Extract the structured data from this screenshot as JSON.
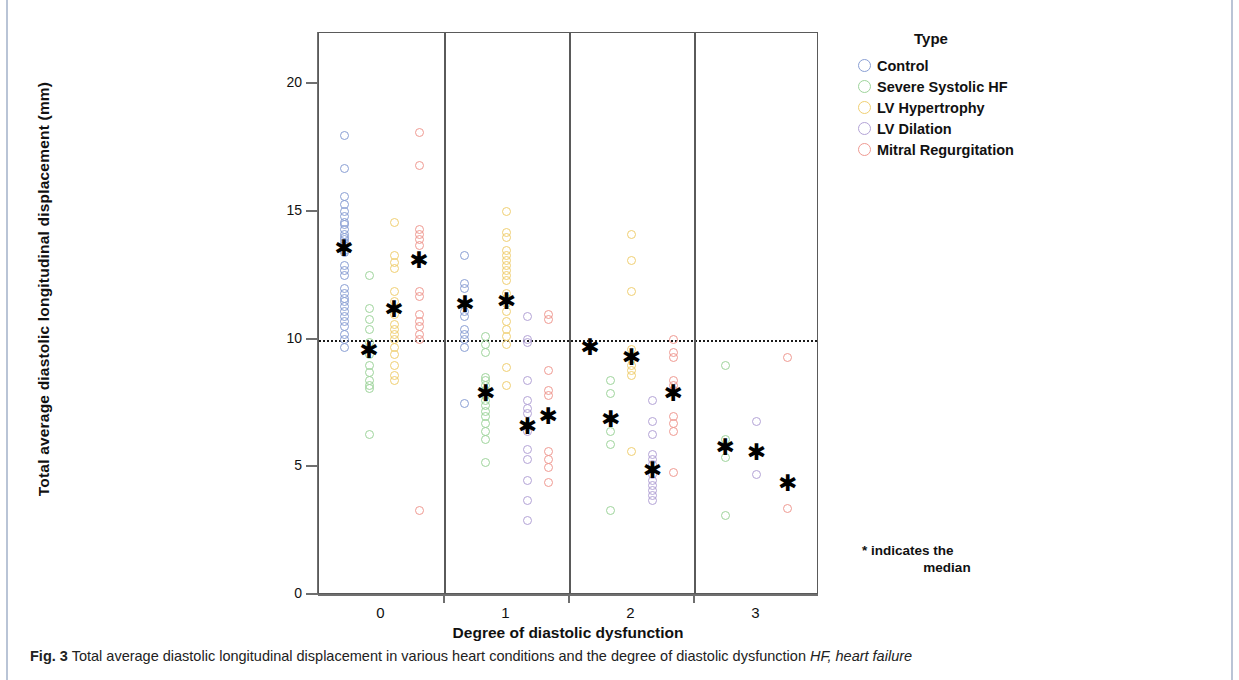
{
  "figure": {
    "caption_number": "Fig. 3",
    "caption_text": "Total average diastolic longitudinal displacement in various heart conditions and the degree of diastolic dysfunction",
    "caption_abbrev": "HF, heart failure"
  },
  "legend": {
    "title": "Type",
    "items": [
      {
        "label": "Control",
        "color": "#8a9fd4"
      },
      {
        "label": "Severe Systolic HF",
        "color": "#9ed49b"
      },
      {
        "label": "LV Hypertrophy",
        "color": "#f0cf72"
      },
      {
        "label": "LV Dilation",
        "color": "#b3a3d6"
      },
      {
        "label": "Mitral Regurgitation",
        "color": "#ef9a92"
      }
    ]
  },
  "annotations": {
    "median_note_line1": "* indicates the",
    "median_note_line2": "median"
  },
  "chart_data": {
    "type": "scatter",
    "title": "",
    "xlabel": "Degree of diastolic dysfunction",
    "ylabel": "Total average diastolic longitudinal displacement (mm)",
    "ylim": [
      0,
      22
    ],
    "yticks": [
      0,
      5,
      10,
      15,
      20
    ],
    "xticks": [
      "0",
      "1",
      "2",
      "3"
    ],
    "grid": false,
    "reference_line": {
      "y": 10,
      "style": "dotted",
      "color": "#1a1a1a"
    },
    "legend_position": "right",
    "panels": [
      {
        "category": "0",
        "groups": [
          {
            "name": "Control",
            "color": "#8a9fd4",
            "median": 13.6,
            "values": [
              18.0,
              16.7,
              15.6,
              15.3,
              15.0,
              14.8,
              14.6,
              14.5,
              14.3,
              14.1,
              14.0,
              13.9,
              13.8,
              13.7,
              13.5,
              13.4,
              12.9,
              12.7,
              12.5,
              12.0,
              11.8,
              11.6,
              11.5,
              11.3,
              11.1,
              10.9,
              10.7,
              10.5,
              10.2,
              10.0,
              9.7
            ]
          },
          {
            "name": "Severe Systolic HF",
            "color": "#9ed49b",
            "median": 9.6,
            "values": [
              12.5,
              11.2,
              10.8,
              10.4,
              9.9,
              9.4,
              9.0,
              8.7,
              8.4,
              8.2,
              8.1,
              6.3
            ]
          },
          {
            "name": "LV Hypertrophy",
            "color": "#f0cf72",
            "median": 11.2,
            "values": [
              14.6,
              13.3,
              13.0,
              12.8,
              11.9,
              11.5,
              11.2,
              11.0,
              10.6,
              10.4,
              10.2,
              10.0,
              9.7,
              9.4,
              9.0,
              8.6,
              8.4
            ]
          },
          {
            "name": "Mitral Regurgitation",
            "color": "#ef9a92",
            "median": 13.1,
            "values": [
              18.1,
              16.8,
              14.3,
              14.1,
              13.9,
              13.7,
              11.9,
              11.7,
              11.0,
              10.7,
              10.5,
              10.2,
              10.0,
              3.3
            ]
          }
        ]
      },
      {
        "category": "1",
        "groups": [
          {
            "name": "Control",
            "color": "#8a9fd4",
            "median": 11.4,
            "values": [
              13.3,
              12.2,
              12.0,
              11.4,
              11.1,
              10.9,
              10.4,
              10.2,
              10.0,
              9.7,
              7.5
            ]
          },
          {
            "name": "Severe Systolic HF",
            "color": "#9ed49b",
            "median": 7.9,
            "values": [
              10.1,
              9.8,
              9.5,
              8.5,
              8.4,
              8.2,
              8.0,
              7.8,
              7.6,
              7.4,
              7.2,
              7.0,
              6.7,
              6.4,
              6.1,
              5.2
            ]
          },
          {
            "name": "LV Hypertrophy",
            "color": "#f0cf72",
            "median": 11.5,
            "values": [
              15.0,
              14.2,
              14.0,
              13.5,
              13.3,
              13.1,
              12.9,
              12.7,
              12.5,
              12.3,
              11.8,
              11.6,
              11.4,
              11.1,
              10.7,
              10.4,
              10.1,
              9.8,
              8.9,
              8.2
            ]
          },
          {
            "name": "LV Dilation",
            "color": "#b3a3d6",
            "median": 6.6,
            "values": [
              10.9,
              10.0,
              9.9,
              8.4,
              7.6,
              7.3,
              7.1,
              6.6,
              6.4,
              5.7,
              5.3,
              4.5,
              3.7,
              2.9
            ]
          },
          {
            "name": "Mitral Regurgitation",
            "color": "#ef9a92",
            "median": 7.0,
            "values": [
              11.0,
              10.8,
              8.8,
              8.0,
              7.8,
              5.6,
              5.3,
              5.0,
              4.4
            ]
          }
        ]
      },
      {
        "category": "2",
        "groups": [
          {
            "name": "Control",
            "color": "#8a9fd4",
            "median": 9.7,
            "values": []
          },
          {
            "name": "Severe Systolic HF",
            "color": "#9ed49b",
            "median": 6.9,
            "values": [
              8.4,
              7.9,
              6.4,
              5.9,
              3.3
            ]
          },
          {
            "name": "LV Hypertrophy",
            "color": "#f0cf72",
            "median": 9.3,
            "values": [
              14.1,
              13.1,
              11.9,
              9.6,
              9.2,
              9.0,
              8.8,
              8.6,
              5.6
            ]
          },
          {
            "name": "LV Dilation",
            "color": "#b3a3d6",
            "median": 4.9,
            "values": [
              7.6,
              6.8,
              6.3,
              5.5,
              5.3,
              5.1,
              4.9,
              4.7,
              4.5,
              4.3,
              4.1,
              3.9,
              3.7
            ]
          },
          {
            "name": "Mitral Regurgitation",
            "color": "#ef9a92",
            "median": 7.9,
            "values": [
              10.0,
              9.5,
              9.3,
              8.4,
              8.2,
              8.0,
              7.0,
              6.7,
              6.4,
              4.8
            ]
          }
        ]
      },
      {
        "category": "3",
        "groups": [
          {
            "name": "Severe Systolic HF",
            "color": "#9ed49b",
            "median": 5.8,
            "values": [
              9.0,
              6.1,
              5.8,
              5.4,
              3.1
            ]
          },
          {
            "name": "LV Dilation",
            "color": "#b3a3d6",
            "median": 5.6,
            "values": [
              6.8,
              4.7
            ]
          },
          {
            "name": "Mitral Regurgitation",
            "color": "#ef9a92",
            "median": 4.4,
            "values": [
              9.3,
              3.4
            ]
          }
        ]
      }
    ]
  }
}
